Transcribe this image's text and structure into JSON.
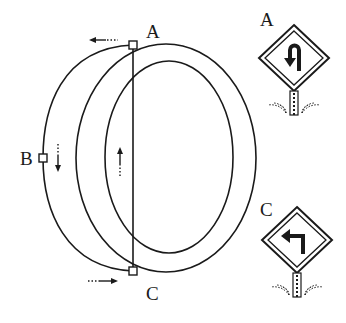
{
  "diagram": {
    "title": "",
    "points": [
      {
        "id": "A",
        "label": "A",
        "x": 133,
        "y": 45
      },
      {
        "id": "B",
        "label": "B",
        "x": 43,
        "y": 158
      },
      {
        "id": "C",
        "label": "C",
        "x": 133,
        "y": 271
      }
    ],
    "arrows": [
      {
        "near": "A",
        "direction": "left"
      },
      {
        "near": "B",
        "direction": "down"
      },
      {
        "near": "C",
        "direction": "right"
      },
      {
        "near": "center-line",
        "direction": "up"
      }
    ],
    "signs": [
      {
        "label": "A",
        "icon": "u-turn-left-sign-icon",
        "description": "diamond road sign with U-turn arrow"
      },
      {
        "label": "C",
        "icon": "left-turn-sign-icon",
        "description": "diamond road sign with left-turn arrow"
      }
    ],
    "colors": {
      "line": "#1a1a1a",
      "background": "#ffffff"
    }
  }
}
